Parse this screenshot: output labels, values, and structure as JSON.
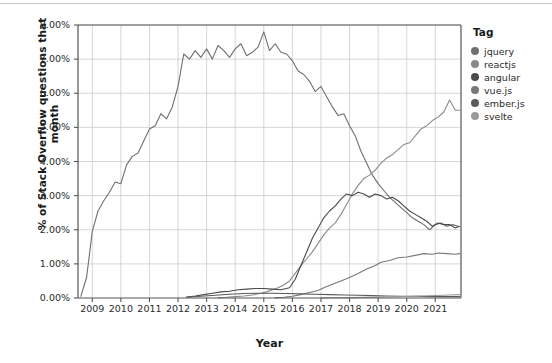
{
  "chart_data": {
    "type": "line",
    "title": "",
    "xlabel": "Year",
    "ylabel": "% of Stack Overflow questions that month",
    "xlim": [
      2008.5,
      2021.9
    ],
    "ylim": [
      0,
      8
    ],
    "grid": true,
    "legend_position": "right",
    "legend_title": "Tag",
    "ytick_labels": [
      "0.00%",
      "1.00%",
      "2.00%",
      "3.00%",
      "4.00%",
      "5.00%",
      "6.00%",
      "7.00%",
      "8.00%"
    ],
    "ytick_values": [
      0,
      1,
      2,
      3,
      4,
      5,
      6,
      7,
      8
    ],
    "xtick_labels": [
      "2009",
      "2010",
      "2011",
      "2012",
      "2013",
      "2014",
      "2015",
      "2016",
      "2017",
      "2018",
      "2019",
      "2020",
      "2021"
    ],
    "xtick_values": [
      2009,
      2010,
      2011,
      2012,
      2013,
      2014,
      2015,
      2016,
      2017,
      2018,
      2019,
      2020,
      2021
    ],
    "colors": {
      "jquery": "#6f6f6f",
      "reactjs": "#8a8a8a",
      "angular": "#4a4a4a",
      "vuejs": "#777777",
      "emberjs": "#5a5a5a",
      "svelte": "#9a9a9a",
      "axis": "#555555",
      "grid": "#cccccc",
      "text": "#2b2b2b",
      "background": "#ffffff"
    },
    "series": [
      {
        "name": "jquery",
        "color": "#6f6f6f",
        "x": [
          2008.6,
          2008.8,
          2009.0,
          2009.2,
          2009.4,
          2009.6,
          2009.8,
          2010.0,
          2010.2,
          2010.4,
          2010.6,
          2010.8,
          2011.0,
          2011.2,
          2011.4,
          2011.6,
          2011.8,
          2012.0,
          2012.2,
          2012.4,
          2012.6,
          2012.8,
          2013.0,
          2013.2,
          2013.4,
          2013.6,
          2013.8,
          2014.0,
          2014.2,
          2014.4,
          2014.6,
          2014.8,
          2015.0,
          2015.2,
          2015.4,
          2015.6,
          2015.8,
          2016.0,
          2016.2,
          2016.4,
          2016.6,
          2016.8,
          2017.0,
          2017.2,
          2017.4,
          2017.6,
          2017.8,
          2018.0,
          2018.2,
          2018.4,
          2018.6,
          2018.8,
          2019.0,
          2019.2,
          2019.4,
          2019.6,
          2019.8,
          2020.0,
          2020.2,
          2020.4,
          2020.6,
          2020.8,
          2021.0,
          2021.2,
          2021.4,
          2021.6,
          2021.8
        ],
        "y": [
          0.05,
          0.6,
          1.95,
          2.55,
          2.85,
          3.1,
          3.4,
          3.35,
          3.9,
          4.15,
          4.25,
          4.6,
          4.95,
          5.05,
          5.4,
          5.25,
          5.6,
          6.2,
          7.15,
          7.0,
          7.25,
          7.05,
          7.3,
          7.0,
          7.4,
          7.25,
          7.05,
          7.3,
          7.45,
          7.1,
          7.2,
          7.35,
          7.8,
          7.25,
          7.45,
          7.2,
          7.15,
          6.95,
          6.65,
          6.55,
          6.35,
          6.05,
          6.2,
          5.9,
          5.6,
          5.35,
          5.4,
          5.05,
          4.75,
          4.3,
          3.95,
          3.6,
          3.35,
          3.15,
          2.95,
          2.8,
          2.65,
          2.5,
          2.35,
          2.25,
          2.15,
          2.0,
          2.15,
          2.2,
          2.1,
          2.15,
          2.1
        ]
      },
      {
        "name": "reactjs",
        "color": "#8a8a8a",
        "x": [
          2013.4,
          2013.7,
          2014.0,
          2014.3,
          2014.6,
          2014.9,
          2015.1,
          2015.3,
          2015.5,
          2015.7,
          2015.9,
          2016.1,
          2016.3,
          2016.5,
          2016.7,
          2016.9,
          2017.1,
          2017.3,
          2017.5,
          2017.7,
          2017.9,
          2018.1,
          2018.3,
          2018.5,
          2018.7,
          2018.9,
          2019.1,
          2019.3,
          2019.5,
          2019.7,
          2019.9,
          2020.1,
          2020.3,
          2020.5,
          2020.7,
          2020.9,
          2021.1,
          2021.3,
          2021.5,
          2021.7,
          2021.85
        ],
        "y": [
          0.01,
          0.02,
          0.04,
          0.06,
          0.09,
          0.14,
          0.18,
          0.24,
          0.3,
          0.38,
          0.5,
          0.72,
          0.95,
          1.15,
          1.35,
          1.6,
          1.85,
          2.05,
          2.2,
          2.45,
          2.75,
          3.05,
          3.3,
          3.5,
          3.6,
          3.75,
          3.95,
          4.1,
          4.2,
          4.35,
          4.5,
          4.55,
          4.75,
          4.95,
          5.05,
          5.2,
          5.3,
          5.45,
          5.8,
          5.5,
          5.5
        ]
      },
      {
        "name": "angular",
        "color": "#4a4a4a",
        "x": [
          2012.3,
          2012.6,
          2012.9,
          2013.2,
          2013.5,
          2013.8,
          2014.1,
          2014.4,
          2014.7,
          2015.0,
          2015.3,
          2015.6,
          2015.9,
          2016.1,
          2016.3,
          2016.5,
          2016.7,
          2016.9,
          2017.1,
          2017.3,
          2017.5,
          2017.7,
          2017.9,
          2018.1,
          2018.3,
          2018.5,
          2018.7,
          2018.9,
          2019.1,
          2019.3,
          2019.5,
          2019.7,
          2019.9,
          2020.1,
          2020.3,
          2020.5,
          2020.7,
          2020.9,
          2021.1,
          2021.3,
          2021.5,
          2021.7,
          2021.85
        ],
        "y": [
          0.03,
          0.06,
          0.1,
          0.14,
          0.18,
          0.2,
          0.24,
          0.26,
          0.28,
          0.28,
          0.26,
          0.24,
          0.3,
          0.55,
          0.95,
          1.35,
          1.75,
          2.05,
          2.35,
          2.55,
          2.7,
          2.9,
          3.05,
          3.0,
          3.1,
          3.05,
          2.95,
          3.05,
          3.0,
          2.9,
          2.95,
          2.85,
          2.7,
          2.55,
          2.45,
          2.35,
          2.25,
          2.1,
          2.2,
          2.15,
          2.15,
          2.05,
          2.1
        ]
      },
      {
        "name": "vue.js",
        "color": "#777777",
        "x": [
          2015.4,
          2015.7,
          2016.0,
          2016.3,
          2016.6,
          2016.9,
          2017.1,
          2017.4,
          2017.7,
          2018.0,
          2018.3,
          2018.6,
          2018.9,
          2019.1,
          2019.4,
          2019.7,
          2020.0,
          2020.3,
          2020.6,
          2020.9,
          2021.1,
          2021.4,
          2021.7,
          2021.85
        ],
        "y": [
          0.01,
          0.02,
          0.05,
          0.1,
          0.16,
          0.22,
          0.3,
          0.4,
          0.5,
          0.6,
          0.72,
          0.85,
          0.95,
          1.05,
          1.1,
          1.18,
          1.2,
          1.25,
          1.3,
          1.28,
          1.32,
          1.3,
          1.28,
          1.3
        ]
      },
      {
        "name": "ember.js",
        "color": "#5a5a5a",
        "x": [
          2012.3,
          2012.8,
          2013.3,
          2013.8,
          2014.3,
          2014.8,
          2015.3,
          2015.8,
          2016.3,
          2016.8,
          2017.3,
          2017.8,
          2018.3,
          2018.8,
          2019.3,
          2019.8,
          2020.3,
          2020.8,
          2021.3,
          2021.85
        ],
        "y": [
          0.02,
          0.05,
          0.08,
          0.11,
          0.13,
          0.14,
          0.14,
          0.13,
          0.12,
          0.11,
          0.1,
          0.09,
          0.08,
          0.07,
          0.06,
          0.05,
          0.05,
          0.04,
          0.04,
          0.04
        ]
      },
      {
        "name": "svelte",
        "color": "#9a9a9a",
        "x": [
          2017.0,
          2017.5,
          2018.0,
          2018.5,
          2019.0,
          2019.5,
          2020.0,
          2020.5,
          2021.0,
          2021.5,
          2021.85
        ],
        "y": [
          0.005,
          0.008,
          0.012,
          0.018,
          0.025,
          0.035,
          0.045,
          0.06,
          0.075,
          0.09,
          0.1
        ]
      }
    ]
  },
  "legend": {
    "title": "Tag",
    "items": [
      {
        "label": "jquery",
        "color": "#6f6f6f"
      },
      {
        "label": "reactjs",
        "color": "#8a8a8a"
      },
      {
        "label": "angular",
        "color": "#4a4a4a"
      },
      {
        "label": "vue.js",
        "color": "#777777"
      },
      {
        "label": "ember.js",
        "color": "#5a5a5a"
      },
      {
        "label": "svelte",
        "color": "#9a9a9a"
      }
    ]
  }
}
